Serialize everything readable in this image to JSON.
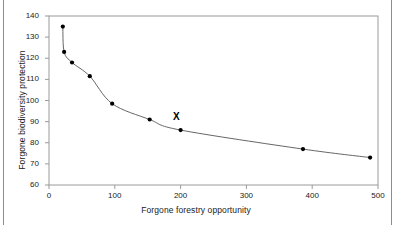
{
  "figure": {
    "background_color": "#ffffff",
    "frame_color": "#9a9a9a",
    "line_color": "#555555",
    "marker_color": "#000000"
  },
  "chart_data": {
    "type": "line",
    "title": "",
    "subtitle": "",
    "xlabel": "Forgone forestry opportunity",
    "ylabel": "Forgone biodiversity protection",
    "xlim": [
      0,
      500
    ],
    "ylim": [
      60,
      140
    ],
    "xticks": [
      0,
      100,
      200,
      300,
      400,
      500
    ],
    "yticks": [
      60,
      70,
      80,
      90,
      100,
      110,
      120,
      130,
      140
    ],
    "xtick_labels": [
      "0",
      "100",
      "200",
      "300",
      "400",
      "500"
    ],
    "ytick_labels": [
      "60",
      "70",
      "80",
      "90",
      "100",
      "110",
      "120",
      "130",
      "140"
    ],
    "grid": false,
    "legend": false,
    "legend_position": "none",
    "markers": "filled-circle",
    "x": [
      21,
      23,
      35,
      62,
      96,
      153,
      200,
      386,
      488
    ],
    "y": [
      135,
      123,
      118,
      111.5,
      98.5,
      91,
      86,
      77,
      73
    ],
    "series": [
      {
        "name": "efficiency frontier",
        "points": [
          {
            "x": 21,
            "y": 135
          },
          {
            "x": 23,
            "y": 123
          },
          {
            "x": 35,
            "y": 118
          },
          {
            "x": 62,
            "y": 111.5
          },
          {
            "x": 96,
            "y": 98.5
          },
          {
            "x": 153,
            "y": 91
          },
          {
            "x": 200,
            "y": 86
          },
          {
            "x": 386,
            "y": 77
          },
          {
            "x": 488,
            "y": 73
          }
        ]
      }
    ],
    "annotations": [
      {
        "label": "X",
        "x": 193,
        "y": 92
      }
    ]
  }
}
